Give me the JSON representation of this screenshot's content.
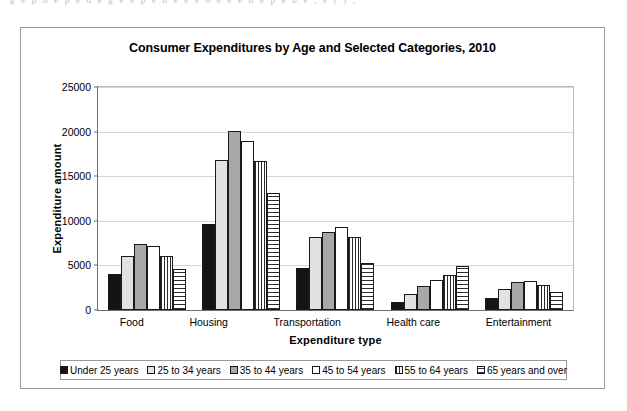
{
  "scan_artifact_text": "g      e  p  o  e  p  e  o  e  g   e  e  p  e   o  e  e   e  o  e  e   e   o    e  p  e  o  e   ,  e  (  )  ,",
  "chart_data": {
    "type": "bar",
    "title": "Consumer Expenditures by Age and Selected Categories, 2010",
    "xlabel": "Expenditure type",
    "ylabel": "Expenditure amount",
    "ylim": [
      0,
      25000
    ],
    "yticks": [
      0,
      5000,
      10000,
      15000,
      20000,
      25000
    ],
    "ytick_labels": [
      "0",
      "5000",
      "10000",
      "15000",
      "20000",
      "25000"
    ],
    "grid": true,
    "legend_position": "bottom",
    "categories": [
      "Food",
      "Housing",
      "Transportation",
      "Health care",
      "Entertainment"
    ],
    "series": [
      {
        "name": "Under 25 years",
        "fill": "solid-black",
        "values": [
          4000,
          9600,
          4750,
          900,
          1350
        ]
      },
      {
        "name": "25 to 34 years",
        "fill": "light-gray",
        "values": [
          6000,
          16800,
          8200,
          1850,
          2300
        ]
      },
      {
        "name": "35 to 44 years",
        "fill": "mid-gray",
        "values": [
          7450,
          20050,
          8800,
          2700,
          3150
        ]
      },
      {
        "name": "45 to 54 years",
        "fill": "white",
        "values": [
          7200,
          18900,
          9300,
          3350,
          3200
        ]
      },
      {
        "name": "55 to 64 years",
        "fill": "vertical-stripe",
        "values": [
          6000,
          16700,
          8150,
          3950,
          2850
        ]
      },
      {
        "name": "65 years and over",
        "fill": "horizontal-stripe",
        "values": [
          4600,
          13100,
          5300,
          4900,
          2000
        ]
      }
    ]
  }
}
